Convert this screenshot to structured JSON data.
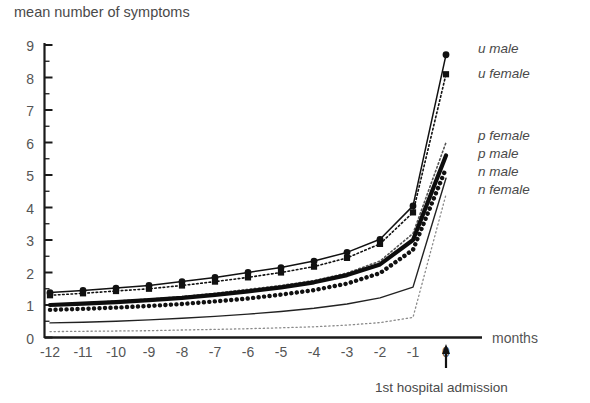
{
  "chart_data": {
    "type": "line",
    "title": "mean number of symptoms",
    "ylabel": "mean number of symptoms",
    "xlabel": "months",
    "x": [
      -12,
      -11,
      -10,
      -9,
      -8,
      -7,
      -6,
      -5,
      -4,
      -3,
      -2,
      -1,
      0
    ],
    "xlim": [
      -12.4,
      0.3
    ],
    "ylim": [
      0,
      9
    ],
    "yticks": [
      "0",
      "1",
      "2",
      "3",
      "4",
      "5",
      "6",
      "7",
      "8",
      "9"
    ],
    "ytick_minor_step": 0.5,
    "xticks": [
      "-12",
      "-11",
      "-10",
      "-9",
      "-8",
      "-7",
      "-6",
      "-5",
      "-4",
      "-3",
      "-2",
      "-1",
      "0"
    ],
    "grid": false,
    "legend_position": "right",
    "annotations": [
      {
        "text": "1st hospital admission",
        "x": 0,
        "note": "arrow pointing up to x = 0 tick"
      }
    ],
    "series": [
      {
        "name": "u male",
        "label": "u male",
        "style": "solid-thin-with-circle-markers",
        "marker": "circle",
        "color": "#111111",
        "values": [
          1.38,
          1.45,
          1.52,
          1.6,
          1.72,
          1.85,
          2.0,
          2.15,
          2.35,
          2.62,
          3.02,
          4.05,
          8.7
        ]
      },
      {
        "name": "u female",
        "label": "u female",
        "style": "dotted-with-square-markers",
        "marker": "square",
        "color": "#111111",
        "values": [
          1.3,
          1.36,
          1.43,
          1.5,
          1.6,
          1.72,
          1.85,
          2.0,
          2.18,
          2.45,
          2.88,
          3.85,
          8.1
        ]
      },
      {
        "name": "p female",
        "label": "p female",
        "style": "fine-dotted",
        "marker": "none",
        "color": "#555555",
        "values": [
          1.02,
          1.06,
          1.12,
          1.18,
          1.26,
          1.36,
          1.48,
          1.6,
          1.75,
          1.98,
          2.35,
          3.2,
          6.0
        ]
      },
      {
        "name": "p male",
        "label": "p male",
        "style": "solid-bold",
        "marker": "none",
        "color": "#0d0d0d",
        "values": [
          1.0,
          1.04,
          1.09,
          1.15,
          1.22,
          1.31,
          1.42,
          1.54,
          1.7,
          1.92,
          2.25,
          3.0,
          5.6
        ]
      },
      {
        "name": "n male",
        "label": "n male",
        "style": "thick-dotted",
        "marker": "none",
        "color": "#111111",
        "values": [
          0.85,
          0.88,
          0.92,
          0.97,
          1.03,
          1.11,
          1.2,
          1.32,
          1.46,
          1.66,
          1.98,
          2.7,
          5.2
        ]
      },
      {
        "name": "n female",
        "label": "n female",
        "style": "solid-thin",
        "marker": "none",
        "color": "#222222",
        "values": [
          0.45,
          0.47,
          0.5,
          0.54,
          0.59,
          0.65,
          0.72,
          0.8,
          0.9,
          1.03,
          1.22,
          1.55,
          4.9
        ]
      },
      {
        "name": "baseline",
        "label": "",
        "style": "fine-dotted-faint",
        "marker": "none",
        "color": "#8a8a8a",
        "values": [
          0.18,
          0.19,
          0.2,
          0.21,
          0.23,
          0.25,
          0.27,
          0.3,
          0.33,
          0.38,
          0.46,
          0.62,
          4.4
        ]
      }
    ]
  },
  "legend": {
    "items": [
      {
        "label": "u male"
      },
      {
        "label": "u female"
      },
      {
        "label": "p female"
      },
      {
        "label": "p male"
      },
      {
        "label": "n male"
      },
      {
        "label": "n female"
      }
    ]
  },
  "axis": {
    "y_title": "mean number of symptoms",
    "x_title": "months"
  },
  "annotation": {
    "admission": "1st hospital admission"
  }
}
